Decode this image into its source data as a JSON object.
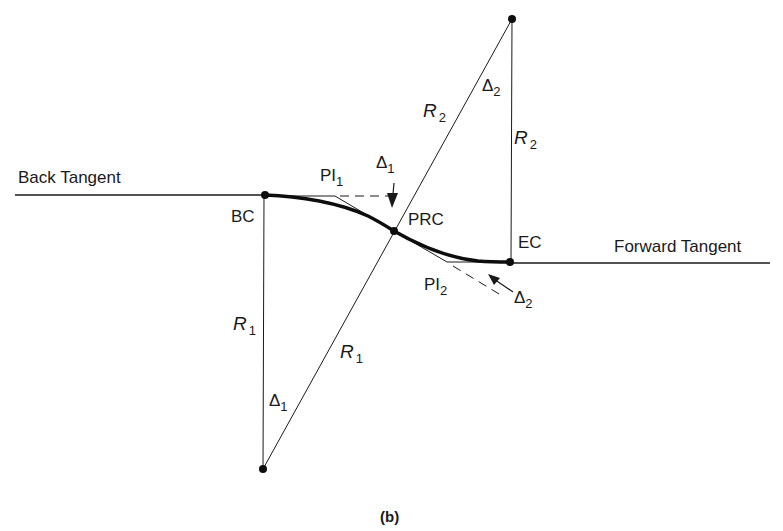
{
  "diagram": {
    "type": "reverse-curve-geometry",
    "caption": "(b)",
    "labels": {
      "back_tangent": "Back Tangent",
      "forward_tangent": "Forward Tangent",
      "bc": "BC",
      "prc": "PRC",
      "ec": "EC",
      "pi1_main": "PI",
      "pi1_sub": "1",
      "pi2_main": "PI",
      "pi2_sub": "2",
      "r1_vertical_main": "R",
      "r1_vertical_sub": "1",
      "r1_diagonal_main": "R",
      "r1_diagonal_sub": "1",
      "r2_diagonal_main": "R",
      "r2_diagonal_sub": "2",
      "r2_vertical_main": "R",
      "r2_vertical_sub": "2",
      "delta1_center_main": "Δ",
      "delta1_center_sub": "1",
      "delta1_pi_main": "Δ",
      "delta1_pi_sub": "1",
      "delta2_center_main": "Δ",
      "delta2_center_sub": "2",
      "delta2_pi_main": "Δ",
      "delta2_pi_sub": "2"
    },
    "points": {
      "center_1": [
        263,
        469
      ],
      "center_2": [
        512,
        19
      ],
      "bc": [
        265,
        195
      ],
      "prc": [
        394,
        231
      ],
      "ec": [
        510,
        262
      ],
      "pi1": [
        335,
        196
      ],
      "pi2": [
        452,
        262
      ]
    },
    "colors": {
      "line": "#1a1a1a",
      "curve": "#0d0d0d",
      "background": "#ffffff"
    }
  }
}
